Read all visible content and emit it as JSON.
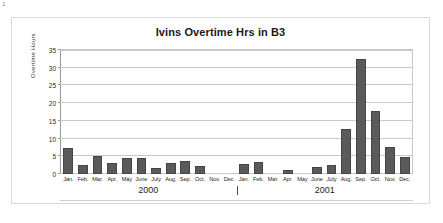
{
  "page": {
    "corner_mark": "1"
  },
  "chart_data": {
    "type": "bar",
    "title": "Ivins Overtime Hrs in B3",
    "xlabel": "",
    "ylabel": "Overtime Hours",
    "ylim": [
      0,
      35
    ],
    "yticks": [
      0,
      5,
      10,
      15,
      20,
      25,
      30,
      35
    ],
    "grid": true,
    "legend": "none",
    "bar_color": "#5a5a5a",
    "categories": [
      "Jan.",
      "Feb.",
      "Mar.",
      "Apr.",
      "May",
      "June",
      "July",
      "Aug.",
      "Sep.",
      "Oct.",
      "Nov.",
      "Dec.",
      "Jan.",
      "Feb.",
      "Mar.",
      "Apr.",
      "May",
      "June",
      "July",
      "Aug.",
      "Sep.",
      "Oct.",
      "Nov.",
      "Dec."
    ],
    "values": [
      7.3,
      2.5,
      5.0,
      3.1,
      4.5,
      4.6,
      1.7,
      3.1,
      3.7,
      2.2,
      0.0,
      0.0,
      2.9,
      3.4,
      0.0,
      1.0,
      0.0,
      2.0,
      2.5,
      12.6,
      32.5,
      17.7,
      7.6,
      4.7
    ],
    "group_labels": [
      {
        "label": "2000",
        "start_index": 0,
        "end_index": 11
      },
      {
        "label": "2001",
        "start_index": 12,
        "end_index": 23
      }
    ],
    "group_separator_index": 12
  }
}
